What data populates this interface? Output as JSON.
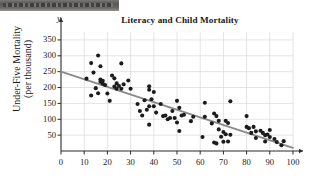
{
  "page": {
    "scan_artifact": "dark-scan-band"
  },
  "chart_data": {
    "type": "scatter",
    "title": "Literacy and Child Mortality",
    "xlabel": "",
    "ylabel": "Under-Five Mortality\n(per thousand)",
    "y_axis_variable_label": "y",
    "xlim": [
      0,
      100
    ],
    "ylim": [
      0,
      375
    ],
    "xticks": [
      0,
      10,
      20,
      30,
      40,
      50,
      60,
      70,
      80,
      90,
      100
    ],
    "yticks": [
      50,
      100,
      150,
      200,
      250,
      300,
      350
    ],
    "grid": true,
    "legend": "none",
    "marker_color": "#1c1c1c",
    "trendline_color": "#8a8a8a",
    "axis_color": "#2b2b2b",
    "grid_color": "#d8d8d8",
    "trendline": {
      "label": "least-squares regression line",
      "x": [
        0,
        100
      ],
      "y": [
        250,
        10
      ]
    },
    "points": [
      [
        11,
        228
      ],
      [
        13,
        277
      ],
      [
        13,
        175
      ],
      [
        14,
        247
      ],
      [
        15,
        198
      ],
      [
        16,
        301
      ],
      [
        16,
        182
      ],
      [
        17,
        267
      ],
      [
        17,
        225
      ],
      [
        17,
        218
      ],
      [
        18,
        221
      ],
      [
        18,
        212
      ],
      [
        19,
        208
      ],
      [
        20,
        181
      ],
      [
        21,
        158
      ],
      [
        22,
        238
      ],
      [
        23,
        203
      ],
      [
        23,
        229
      ],
      [
        24,
        213
      ],
      [
        24,
        196
      ],
      [
        25,
        205
      ],
      [
        26,
        276
      ],
      [
        26,
        196
      ],
      [
        27,
        210
      ],
      [
        29,
        222
      ],
      [
        30,
        196
      ],
      [
        33,
        148
      ],
      [
        34,
        126
      ],
      [
        35,
        112
      ],
      [
        36,
        160
      ],
      [
        37,
        130
      ],
      [
        38,
        83
      ],
      [
        38,
        204
      ],
      [
        38,
        193
      ],
      [
        38,
        141
      ],
      [
        39,
        163
      ],
      [
        40,
        186
      ],
      [
        40,
        141
      ],
      [
        41,
        121
      ],
      [
        43,
        148
      ],
      [
        44,
        110
      ],
      [
        45,
        112
      ],
      [
        46,
        100
      ],
      [
        47,
        104
      ],
      [
        48,
        126
      ],
      [
        49,
        104
      ],
      [
        50,
        158
      ],
      [
        50,
        90
      ],
      [
        51,
        136
      ],
      [
        51,
        63
      ],
      [
        52,
        112
      ],
      [
        53,
        114
      ],
      [
        56,
        94
      ],
      [
        57,
        108
      ],
      [
        61,
        44
      ],
      [
        62,
        152
      ],
      [
        62,
        108
      ],
      [
        65,
        87
      ],
      [
        66,
        118
      ],
      [
        66,
        27
      ],
      [
        67,
        110
      ],
      [
        67,
        24
      ],
      [
        68,
        68
      ],
      [
        68,
        95
      ],
      [
        69,
        45
      ],
      [
        70,
        60
      ],
      [
        70,
        29
      ],
      [
        71,
        95
      ],
      [
        71,
        53
      ],
      [
        72,
        30
      ],
      [
        72,
        88
      ],
      [
        73,
        157
      ],
      [
        73,
        51
      ],
      [
        80,
        110
      ],
      [
        80,
        76
      ],
      [
        81,
        72
      ],
      [
        82,
        57
      ],
      [
        83,
        76
      ],
      [
        84,
        62
      ],
      [
        84,
        41
      ],
      [
        86,
        64
      ],
      [
        87,
        57
      ],
      [
        88,
        50
      ],
      [
        88,
        30
      ],
      [
        89,
        52
      ],
      [
        90,
        66
      ],
      [
        90,
        44
      ],
      [
        92,
        38
      ],
      [
        93,
        28
      ],
      [
        95,
        18
      ],
      [
        96,
        31
      ]
    ]
  }
}
